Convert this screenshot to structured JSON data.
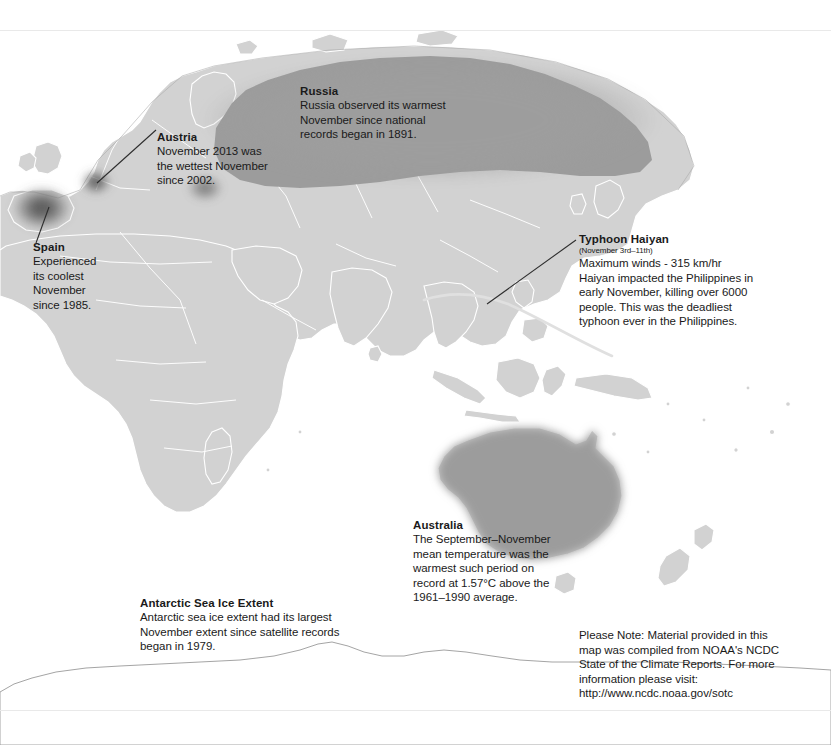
{
  "map": {
    "kind": "world-map-climate-annotations",
    "projection": "eastern-hemisphere",
    "colors": {
      "ocean": "#ffffff",
      "land": "#d2d2d2",
      "land_border": "#ffffff",
      "coastline": "#9a9a9a",
      "highlight_fill": "#9b9b9b",
      "highlight_dark": "#6a6a6a",
      "text": "#1a1a1a",
      "leader_line": "#333333",
      "storm_track": "#e2e2e2",
      "page_edge": "#e9e9e9"
    },
    "highlight_regions": [
      {
        "name": "russia-highlight",
        "label": "Russia",
        "style": "soft-shaded"
      },
      {
        "name": "austria-highlight",
        "label": "Austria",
        "style": "dark-blob"
      },
      {
        "name": "spain-highlight",
        "label": "Spain",
        "style": "dark-blob"
      },
      {
        "name": "australia-highlight",
        "label": "Australia",
        "style": "solid-shaded"
      },
      {
        "name": "haiyan-track",
        "label": "Typhoon Haiyan",
        "style": "track-line"
      }
    ]
  },
  "annotations": {
    "russia": {
      "title": "Russia",
      "lines": [
        "Russia observed its warmest",
        "November since national",
        "records began in 1891."
      ]
    },
    "austria": {
      "title": "Austria",
      "lines": [
        "November 2013 was",
        "the wettest November",
        "since 2002."
      ]
    },
    "spain": {
      "title": "Spain",
      "lines": [
        "Experienced",
        "its coolest",
        "November",
        "since 1985."
      ]
    },
    "typhoon": {
      "title": "Typhoon Haiyan",
      "subtitle": "(November 3rd–11th)",
      "lines": [
        "Maximum winds - 315 km/hr",
        "Haiyan impacted the Philippines in",
        "early November, killing over 6000",
        "people. This was the deadliest",
        "typhoon ever in the Philippines."
      ]
    },
    "australia": {
      "title": "Australia",
      "lines": [
        "The September–November",
        "mean temperature was the",
        "warmest such period on",
        "record at 1.57°C above the",
        "1961–1990 average."
      ]
    },
    "antarctic": {
      "title": "Antarctic Sea Ice Extent",
      "lines": [
        "Antarctic sea ice extent had its largest",
        "November extent since satellite records",
        "began in 1979."
      ]
    }
  },
  "note": {
    "lines": [
      "Please Note: Material provided in this",
      "map was compiled from NOAA's NCDC",
      "State of the Climate Reports. For more",
      "information please visit:",
      "http://www.ncdc.noaa.gov/sotc"
    ]
  }
}
